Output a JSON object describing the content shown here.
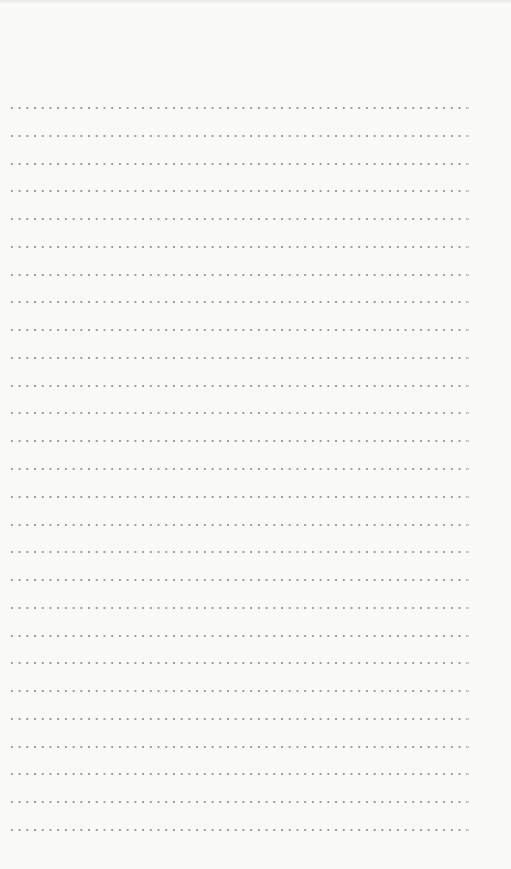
{
  "page": {
    "type": "dotted-line-writing-paper",
    "row_count": 27,
    "colors": {
      "paper": "#f9f9f8",
      "dots": "#8c8c8c"
    }
  }
}
